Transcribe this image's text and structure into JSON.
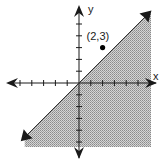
{
  "chart_data": {
    "type": "scatter",
    "title": "",
    "xlabel": "x",
    "ylabel": "y",
    "xlim": [
      -6,
      6
    ],
    "ylim": [
      -6,
      6
    ],
    "grid": false,
    "x_ticks": [
      -5,
      -4,
      -3,
      -2,
      -1,
      1,
      2,
      3,
      4,
      5
    ],
    "y_ticks": [
      -5,
      -4,
      -3,
      -2,
      -1,
      1,
      2,
      3,
      4,
      5
    ],
    "boundary_line": {
      "equation": "y = x",
      "slope": 1,
      "intercept": 0,
      "style": "solid"
    },
    "shaded_region": {
      "inequality": "y <= x",
      "side": "below-right"
    },
    "points": [
      {
        "x": 2,
        "y": 3,
        "label": "(2,3)"
      }
    ],
    "colors": {
      "shade": "#b4b4b4",
      "axis": "#1a1a1a",
      "point": "#000000"
    }
  }
}
